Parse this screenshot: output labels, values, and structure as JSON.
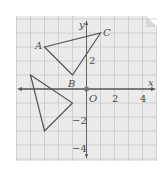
{
  "diagram": {
    "type": "coordinate-grid",
    "axes": {
      "x_label": "x",
      "y_label": "y",
      "origin_label": "O"
    },
    "x_ticks": [
      {
        "value": 2,
        "label": "2"
      },
      {
        "value": 4,
        "label": "4"
      }
    ],
    "y_ticks": [
      {
        "value": 2,
        "label": "2"
      },
      {
        "value": -2,
        "label": "−2"
      },
      {
        "value": -4,
        "label": "−4"
      }
    ],
    "triangle_abc": {
      "vertices": [
        {
          "name": "A",
          "x": -3,
          "y": 3
        },
        {
          "name": "B",
          "x": -1,
          "y": 1
        },
        {
          "name": "C",
          "x": 1,
          "y": 4
        }
      ]
    },
    "triangle_image": {
      "vertices": [
        {
          "x": -4,
          "y": 1
        },
        {
          "x": -1,
          "y": -1
        },
        {
          "x": -3,
          "y": -3
        }
      ]
    },
    "colors": {
      "paper": "#ebebeb",
      "grid": "#c9c9c9",
      "ink": "#555555"
    }
  }
}
